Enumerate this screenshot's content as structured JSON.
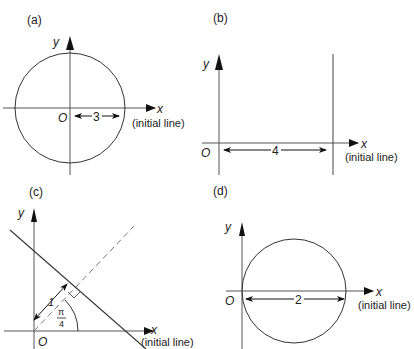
{
  "figure": {
    "panels": [
      {
        "id": "a",
        "label": "(a)",
        "y_axis": "y",
        "x_axis": "x",
        "x_axis_note": "(initial line)",
        "origin": "O",
        "shape": "circle centered at origin",
        "dimension_label": "3"
      },
      {
        "id": "b",
        "label": "(b)",
        "y_axis": "y",
        "x_axis": "x",
        "x_axis_note": "(initial line)",
        "origin": "O",
        "shape": "vertical line x = 4",
        "dimension_label": "4"
      },
      {
        "id": "c",
        "label": "(c)",
        "y_axis": "y",
        "x_axis": "x",
        "x_axis_note": "(initial  line)",
        "origin": "O",
        "shape": "line perpendicular to ray at angle pi/4, distance 1 from O",
        "dimension_label": "1",
        "angle_numerator": "π",
        "angle_denominator": "4"
      },
      {
        "id": "d",
        "label": "(d)",
        "y_axis": "y",
        "x_axis": "x",
        "x_axis_note": "(initial line)",
        "origin": "O",
        "shape": "circle of diameter 2 passing through origin",
        "dimension_label": "2"
      }
    ],
    "colors": {
      "line": "#333333",
      "axis": "#555555",
      "dashed": "#777777",
      "background": "#ffffff"
    }
  }
}
